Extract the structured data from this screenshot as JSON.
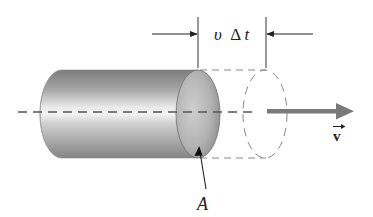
{
  "diagram": {
    "labels": {
      "length_v": "υ",
      "length_delta": "Δ",
      "length_t": "t",
      "area": "A",
      "velocity": "v"
    },
    "colors": {
      "line": "#333333",
      "dashed": "#777777",
      "velocity_arrow": "#7a7a7a",
      "cylinder_dark": "#7c7c7c",
      "cylinder_light": "#f2f2f2",
      "cap_light": "#c4c4c4",
      "cap_dark": "#8a8a8a"
    },
    "elements": [
      "cylinder-body",
      "cylinder-end-cap",
      "dashed-swept-volume",
      "dashed-ellipse",
      "center-axis",
      "dimension-arrows",
      "velocity-arrow",
      "area-leader-arrow"
    ]
  }
}
